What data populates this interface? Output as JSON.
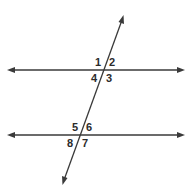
{
  "diagram": {
    "line_color": "#3a3a3a",
    "angles_top": [
      {
        "id": "1",
        "label": "1"
      },
      {
        "id": "2",
        "label": "2"
      },
      {
        "id": "3",
        "label": "3"
      },
      {
        "id": "4",
        "label": "4"
      }
    ],
    "angles_bottom": [
      {
        "id": "5",
        "label": "5"
      },
      {
        "id": "6",
        "label": "6"
      },
      {
        "id": "7",
        "label": "7"
      },
      {
        "id": "8",
        "label": "8"
      }
    ]
  }
}
